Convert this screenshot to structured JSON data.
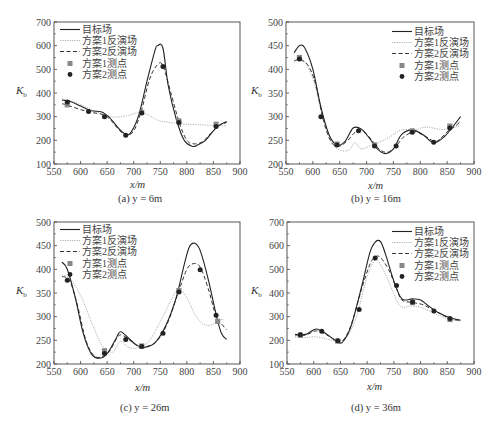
{
  "legend_labels": [
    "目标场",
    "方案1反演场",
    "方案2反演场",
    "方案1测点",
    "方案2测点"
  ],
  "styles": {
    "target": {
      "color": "#222222",
      "width": 1.1,
      "dash": ""
    },
    "scheme1": {
      "color": "#9a9a9a",
      "width": 0.8,
      "dash": "1.2,1.2"
    },
    "scheme2": {
      "color": "#333333",
      "width": 1.0,
      "dash": "4,2.5"
    },
    "pts1_color": "#888888",
    "pts2_color": "#222222"
  },
  "chart_data": [
    {
      "id": "a",
      "type": "line",
      "caption": "(a) y = 6m",
      "xlabel": "x/m",
      "ylabel": "Kb",
      "xlim": [
        550,
        900
      ],
      "ylim": [
        100,
        700
      ],
      "xticks": [
        550,
        600,
        650,
        700,
        750,
        800,
        850,
        900
      ],
      "yticks": [
        100,
        200,
        300,
        400,
        500,
        600,
        700
      ],
      "frame": {
        "left": 54,
        "top": 22,
        "right": 240,
        "bottom": 164
      },
      "legend_pos": {
        "left": 58,
        "top": 24
      },
      "series": [
        {
          "name": "目标场",
          "style": "target",
          "x": [
            565,
            580,
            600,
            620,
            640,
            655,
            670,
            685,
            695,
            710,
            725,
            740,
            745,
            755,
            765,
            780,
            795,
            810,
            820,
            835,
            850,
            862,
            875
          ],
          "y": [
            370,
            365,
            345,
            325,
            320,
            295,
            255,
            225,
            235,
            310,
            450,
            580,
            600,
            590,
            430,
            290,
            200,
            175,
            180,
            200,
            240,
            265,
            280
          ]
        },
        {
          "name": "方案1反演场",
          "style": "scheme1",
          "x": [
            565,
            590,
            610,
            630,
            650,
            665,
            690,
            710,
            725,
            745,
            760,
            780,
            800,
            830,
            860,
            875
          ],
          "y": [
            375,
            360,
            340,
            320,
            305,
            298,
            305,
            318,
            310,
            285,
            278,
            272,
            268,
            265,
            262,
            262
          ]
        },
        {
          "name": "方案2反演场",
          "style": "scheme2",
          "x": [
            565,
            580,
            600,
            620,
            640,
            655,
            670,
            685,
            700,
            715,
            730,
            745,
            755,
            770,
            785,
            800,
            815,
            830,
            845,
            860,
            875
          ],
          "y": [
            355,
            345,
            330,
            318,
            310,
            290,
            250,
            222,
            240,
            330,
            460,
            520,
            515,
            400,
            280,
            200,
            185,
            195,
            230,
            262,
            275
          ]
        },
        {
          "name": "方案1测点",
          "style": "pts1",
          "marker": "square",
          "x": [
            575,
            715,
            785,
            855
          ],
          "y": [
            350,
            318,
            282,
            268
          ]
        },
        {
          "name": "方案2测点",
          "style": "pts2",
          "marker": "circle",
          "x": [
            575,
            615,
            645,
            685,
            715,
            755,
            785,
            855
          ],
          "y": [
            362,
            322,
            300,
            222,
            315,
            512,
            275,
            258
          ]
        }
      ]
    },
    {
      "id": "b",
      "type": "line",
      "caption": "(b) y = 16m",
      "xlabel": "x/m",
      "ylabel": "Kb",
      "xlim": [
        550,
        900
      ],
      "ylim": [
        200,
        500
      ],
      "xticks": [
        550,
        600,
        650,
        700,
        750,
        800,
        850,
        900
      ],
      "yticks": [
        200,
        250,
        300,
        350,
        400,
        450,
        500
      ],
      "frame": {
        "left": 286,
        "top": 22,
        "right": 474,
        "bottom": 164
      },
      "legend_pos": {
        "left": 390,
        "top": 26
      },
      "series": [
        {
          "name": "目标场",
          "style": "target",
          "x": [
            565,
            575,
            585,
            600,
            615,
            630,
            645,
            660,
            675,
            690,
            705,
            720,
            735,
            750,
            765,
            785,
            805,
            825,
            845,
            860,
            875
          ],
          "y": [
            435,
            450,
            445,
            400,
            320,
            262,
            240,
            248,
            276,
            274,
            255,
            232,
            222,
            232,
            262,
            272,
            262,
            245,
            258,
            278,
            300
          ]
        },
        {
          "name": "方案1反演场",
          "style": "scheme1",
          "x": [
            565,
            580,
            600,
            620,
            640,
            665,
            678,
            690,
            710,
            740,
            765,
            790,
            810,
            840,
            860,
            875
          ],
          "y": [
            415,
            422,
            380,
            295,
            238,
            228,
            245,
            232,
            240,
            255,
            272,
            272,
            278,
            273,
            276,
            282
          ]
        },
        {
          "name": "方案2反演场",
          "style": "scheme2",
          "x": [
            565,
            575,
            590,
            605,
            620,
            635,
            650,
            665,
            680,
            695,
            710,
            725,
            740,
            755,
            770,
            790,
            810,
            830,
            850,
            865,
            875
          ],
          "y": [
            418,
            420,
            410,
            370,
            290,
            245,
            238,
            250,
            268,
            268,
            250,
            230,
            225,
            238,
            258,
            268,
            258,
            248,
            268,
            280,
            290
          ]
        },
        {
          "name": "方案1测点",
          "style": "pts1",
          "marker": "square",
          "x": [
            575,
            645,
            715,
            785,
            855
          ],
          "y": [
            425,
            242,
            240,
            270,
            280
          ]
        },
        {
          "name": "方案2测点",
          "style": "pts2",
          "marker": "circle",
          "x": [
            575,
            615,
            645,
            685,
            715,
            755,
            785,
            825,
            855
          ],
          "y": [
            422,
            300,
            240,
            270,
            238,
            238,
            267,
            246,
            276
          ]
        }
      ]
    },
    {
      "id": "c",
      "type": "line",
      "caption": "(c) y = 26m",
      "xlabel": "x/m",
      "ylabel": "Kb",
      "xlim": [
        550,
        900
      ],
      "ylim": [
        200,
        500
      ],
      "xticks": [
        550,
        600,
        650,
        700,
        750,
        800,
        850,
        900
      ],
      "yticks": [
        200,
        250,
        300,
        350,
        400,
        450,
        500
      ],
      "frame": {
        "left": 54,
        "top": 222,
        "right": 240,
        "bottom": 364
      },
      "legend_pos": {
        "left": 58,
        "top": 224
      },
      "series": [
        {
          "name": "目标场",
          "style": "target",
          "x": [
            565,
            575,
            590,
            605,
            620,
            635,
            650,
            665,
            675,
            690,
            705,
            720,
            740,
            760,
            780,
            795,
            805,
            815,
            825,
            840,
            855,
            865,
            875
          ],
          "y": [
            415,
            400,
            340,
            265,
            222,
            212,
            222,
            250,
            268,
            255,
            240,
            235,
            245,
            280,
            340,
            410,
            448,
            455,
            440,
            380,
            305,
            265,
            252
          ]
        },
        {
          "name": "方案1反演场",
          "style": "scheme1",
          "x": [
            565,
            580,
            600,
            620,
            640,
            660,
            675,
            690,
            710,
            730,
            755,
            770,
            785,
            800,
            815,
            830,
            845,
            860,
            870
          ],
          "y": [
            388,
            380,
            345,
            290,
            240,
            225,
            248,
            235,
            235,
            250,
            300,
            335,
            358,
            340,
            305,
            285,
            282,
            292,
            295
          ]
        },
        {
          "name": "方案2反演场",
          "style": "scheme2",
          "x": [
            565,
            580,
            595,
            610,
            625,
            640,
            655,
            670,
            680,
            695,
            710,
            725,
            745,
            765,
            785,
            800,
            812,
            825,
            840,
            855,
            865,
            875
          ],
          "y": [
            385,
            375,
            320,
            250,
            218,
            215,
            228,
            258,
            260,
            248,
            238,
            237,
            250,
            290,
            355,
            400,
            412,
            405,
            360,
            300,
            285,
            272
          ]
        },
        {
          "name": "方案1测点",
          "style": "pts1",
          "marker": "square",
          "x": [
            645,
            715,
            785,
            858
          ],
          "y": [
            228,
            238,
            355,
            290
          ]
        },
        {
          "name": "方案2测点",
          "style": "pts2",
          "marker": "circle",
          "x": [
            575,
            645,
            685,
            715,
            755,
            785,
            825,
            855
          ],
          "y": [
            377,
            222,
            252,
            237,
            265,
            352,
            399,
            303
          ]
        }
      ]
    },
    {
      "id": "d",
      "type": "line",
      "caption": "(d) y = 36m",
      "xlabel": "x/m",
      "ylabel": "Kb",
      "xlim": [
        550,
        900
      ],
      "ylim": [
        100,
        700
      ],
      "xticks": [
        550,
        600,
        650,
        700,
        750,
        800,
        850,
        900
      ],
      "yticks": [
        100,
        200,
        300,
        400,
        500,
        600,
        700
      ],
      "frame": {
        "left": 287,
        "top": 222,
        "right": 474,
        "bottom": 364
      },
      "legend_pos": {
        "left": 390,
        "top": 226
      },
      "series": [
        {
          "name": "目标场",
          "style": "target",
          "x": [
            565,
            585,
            605,
            625,
            645,
            655,
            670,
            690,
            705,
            715,
            725,
            735,
            750,
            765,
            785,
            800,
            815,
            835,
            855,
            875
          ],
          "y": [
            225,
            225,
            248,
            225,
            192,
            195,
            260,
            430,
            570,
            615,
            617,
            560,
            450,
            375,
            375,
            370,
            345,
            315,
            295,
            285
          ]
        },
        {
          "name": "方案1反演场",
          "style": "scheme1",
          "x": [
            565,
            585,
            605,
            625,
            640,
            660,
            680,
            700,
            715,
            725,
            740,
            755,
            765,
            780,
            800,
            830,
            855,
            875
          ],
          "y": [
            215,
            212,
            215,
            205,
            200,
            210,
            300,
            470,
            540,
            520,
            450,
            370,
            340,
            345,
            340,
            310,
            288,
            282
          ]
        },
        {
          "name": "方案2反演场",
          "style": "scheme2",
          "x": [
            565,
            585,
            605,
            625,
            645,
            655,
            670,
            690,
            705,
            715,
            725,
            740,
            755,
            765,
            785,
            805,
            830,
            855,
            875
          ],
          "y": [
            222,
            222,
            240,
            222,
            195,
            200,
            265,
            420,
            520,
            552,
            550,
            500,
            420,
            370,
            360,
            350,
            320,
            292,
            284
          ]
        },
        {
          "name": "方案1测点",
          "style": "pts1",
          "marker": "square",
          "x": [
            575,
            645,
            785,
            855
          ],
          "y": [
            222,
            197,
            360,
            288
          ]
        },
        {
          "name": "方案2测点",
          "style": "pts2",
          "marker": "circle",
          "x": [
            575,
            615,
            645,
            685,
            715,
            755,
            785,
            825,
            855
          ],
          "y": [
            224,
            238,
            198,
            330,
            548,
            432,
            362,
            324,
            292
          ]
        }
      ]
    }
  ]
}
